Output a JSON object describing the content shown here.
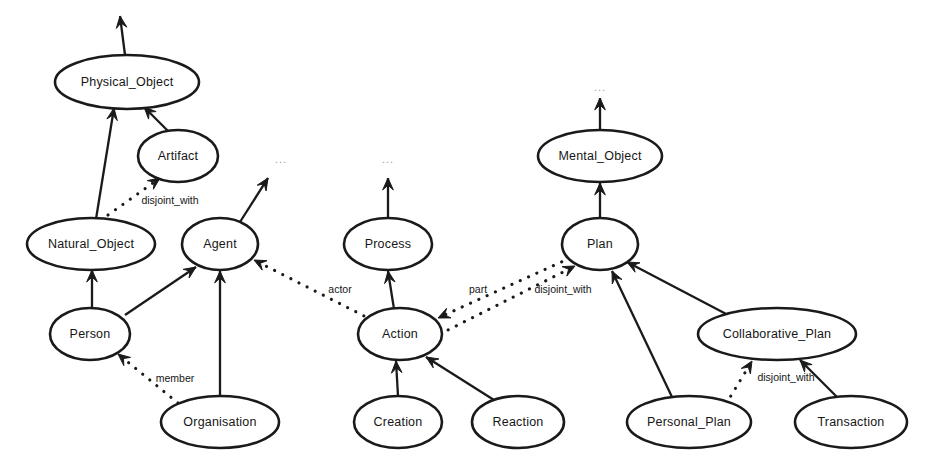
{
  "diagram": {
    "type": "ontology-graph",
    "width": 932,
    "height": 476,
    "background_color": "#ffffff",
    "node_fill_color": "#ffffff",
    "node_stroke_color": "#1a1a1a",
    "text_color": "#161616",
    "ellipsis_color": "#9a9a9a"
  },
  "nodes": [
    {
      "id": "physical_object",
      "label": "Physical_Object",
      "cx": 127,
      "cy": 82,
      "rx": 72,
      "ry": 27
    },
    {
      "id": "artifact",
      "label": "Artifact",
      "cx": 178,
      "cy": 156,
      "rx": 40,
      "ry": 26
    },
    {
      "id": "mental_object",
      "label": "Mental_Object",
      "cx": 600,
      "cy": 156,
      "rx": 62,
      "ry": 26
    },
    {
      "id": "natural_object",
      "label": "Natural_Object",
      "cx": 91,
      "cy": 244,
      "rx": 64,
      "ry": 26
    },
    {
      "id": "agent",
      "label": "Agent",
      "cx": 220,
      "cy": 244,
      "rx": 38,
      "ry": 26
    },
    {
      "id": "process",
      "label": "Process",
      "cx": 388,
      "cy": 244,
      "rx": 44,
      "ry": 26
    },
    {
      "id": "plan",
      "label": "Plan",
      "cx": 600,
      "cy": 244,
      "rx": 38,
      "ry": 26
    },
    {
      "id": "person",
      "label": "Person",
      "cx": 90,
      "cy": 334,
      "rx": 40,
      "ry": 26
    },
    {
      "id": "action",
      "label": "Action",
      "cx": 400,
      "cy": 334,
      "rx": 42,
      "ry": 26
    },
    {
      "id": "collaborative_plan",
      "label": "Collaborative_Plan",
      "cx": 777,
      "cy": 334,
      "rx": 79,
      "ry": 26
    },
    {
      "id": "organisation",
      "label": "Organisation",
      "cx": 220,
      "cy": 422,
      "rx": 59,
      "ry": 26
    },
    {
      "id": "creation",
      "label": "Creation",
      "cx": 398,
      "cy": 422,
      "rx": 44,
      "ry": 26
    },
    {
      "id": "reaction",
      "label": "Reaction",
      "cx": 518,
      "cy": 422,
      "rx": 46,
      "ry": 26
    },
    {
      "id": "personal_plan",
      "label": "Personal_Plan",
      "cx": 689,
      "cy": 422,
      "rx": 62,
      "ry": 26
    },
    {
      "id": "transaction",
      "label": "Transaction",
      "cx": 851,
      "cy": 422,
      "rx": 56,
      "ry": 26
    }
  ],
  "edges": [
    {
      "id": "e1",
      "from": "physical_object",
      "to": "top_ellipsis_left",
      "style": "solid",
      "label": "",
      "x1": 125,
      "y1": 55,
      "x2": 120,
      "y2": 16
    },
    {
      "id": "e2",
      "from": "artifact",
      "to": "physical_object",
      "style": "solid",
      "label": "",
      "x1": 168,
      "y1": 131,
      "x2": 144,
      "y2": 107
    },
    {
      "id": "e3",
      "from": "natural_object",
      "to": "physical_object",
      "style": "solid",
      "label": "",
      "x1": 96,
      "y1": 219,
      "x2": 114,
      "y2": 108
    },
    {
      "id": "e4",
      "from": "natural_object",
      "to": "artifact",
      "style": "dotted",
      "label": "disjoint_with",
      "x1": 108,
      "y1": 215,
      "x2": 160,
      "y2": 178,
      "lx": 170,
      "ly": 201
    },
    {
      "id": "e5",
      "from": "person",
      "to": "natural_object",
      "style": "solid",
      "label": "",
      "x1": 92,
      "y1": 309,
      "x2": 92,
      "y2": 270
    },
    {
      "id": "e6",
      "from": "person",
      "to": "agent",
      "style": "solid",
      "label": "",
      "x1": 125,
      "y1": 315,
      "x2": 196,
      "y2": 267
    },
    {
      "id": "e7",
      "from": "organisation",
      "to": "agent",
      "style": "solid",
      "label": "",
      "x1": 220,
      "y1": 397,
      "x2": 220,
      "y2": 271
    },
    {
      "id": "e8",
      "from": "organisation",
      "to": "person",
      "style": "dotted",
      "label": "member",
      "x1": 178,
      "y1": 403,
      "x2": 118,
      "y2": 354,
      "lx": 175,
      "ly": 379
    },
    {
      "id": "e9",
      "from": "agent",
      "to": "upper_ellipsis_mid1",
      "style": "solid",
      "label": "",
      "x1": 240,
      "y1": 222,
      "x2": 268,
      "y2": 178
    },
    {
      "id": "e10",
      "from": "action",
      "to": "agent",
      "style": "dotted",
      "label": "actor",
      "x1": 372,
      "y1": 320,
      "x2": 254,
      "y2": 260,
      "lx": 340,
      "ly": 290
    },
    {
      "id": "e11",
      "from": "action",
      "to": "process",
      "style": "solid",
      "label": "",
      "x1": 394,
      "y1": 309,
      "x2": 388,
      "y2": 271
    },
    {
      "id": "e12",
      "from": "process",
      "to": "upper_ellipsis_mid2",
      "style": "solid",
      "label": "",
      "x1": 388,
      "y1": 218,
      "x2": 388,
      "y2": 178
    },
    {
      "id": "e13",
      "from": "plan",
      "to": "action",
      "style": "dotted",
      "label": "part",
      "x1": 570,
      "y1": 258,
      "x2": 438,
      "y2": 318,
      "lx": 478,
      "ly": 290
    },
    {
      "id": "e14",
      "from": "action",
      "to": "plan",
      "style": "dotted",
      "label": "disjoint_with",
      "x1": 440,
      "y1": 334,
      "x2": 575,
      "y2": 266,
      "lx": 563,
      "ly": 290
    },
    {
      "id": "e15",
      "from": "plan",
      "to": "mental_object",
      "style": "solid",
      "label": "",
      "x1": 600,
      "y1": 218,
      "x2": 600,
      "y2": 183
    },
    {
      "id": "e16",
      "from": "mental_object",
      "to": "top_ellipsis_right",
      "style": "solid",
      "label": "",
      "x1": 600,
      "y1": 130,
      "x2": 600,
      "y2": 98
    },
    {
      "id": "e17",
      "from": "creation",
      "to": "action",
      "style": "solid",
      "label": "",
      "x1": 398,
      "y1": 396,
      "x2": 396,
      "y2": 361
    },
    {
      "id": "e18",
      "from": "reaction",
      "to": "action",
      "style": "solid",
      "label": "",
      "x1": 494,
      "y1": 400,
      "x2": 426,
      "y2": 357
    },
    {
      "id": "e19",
      "from": "personal_plan",
      "to": "plan",
      "style": "solid",
      "label": "",
      "x1": 672,
      "y1": 397,
      "x2": 612,
      "y2": 271
    },
    {
      "id": "e20",
      "from": "collaborative_plan",
      "to": "plan",
      "style": "solid",
      "label": "",
      "x1": 730,
      "y1": 316,
      "x2": 627,
      "y2": 262
    },
    {
      "id": "e21",
      "from": "personal_plan",
      "to": "collaborative_plan",
      "style": "dotted",
      "label": "disjoint_with",
      "x1": 726,
      "y1": 404,
      "x2": 752,
      "y2": 361,
      "lx": 786,
      "ly": 378
    },
    {
      "id": "e22",
      "from": "transaction",
      "to": "collaborative_plan",
      "style": "solid",
      "label": "",
      "x1": 838,
      "y1": 398,
      "x2": 800,
      "y2": 360
    }
  ],
  "ellipsis_markers": [
    {
      "id": "top_ellipsis_right",
      "text": "...",
      "x": 600,
      "y": 88
    },
    {
      "id": "upper_ellipsis_mid1",
      "text": "...",
      "x": 281,
      "y": 160
    },
    {
      "id": "upper_ellipsis_mid2",
      "text": "...",
      "x": 388,
      "y": 160
    }
  ],
  "edge_labels": {
    "disjoint_with": "disjoint_with",
    "member": "member",
    "actor": "actor",
    "part": "part"
  }
}
